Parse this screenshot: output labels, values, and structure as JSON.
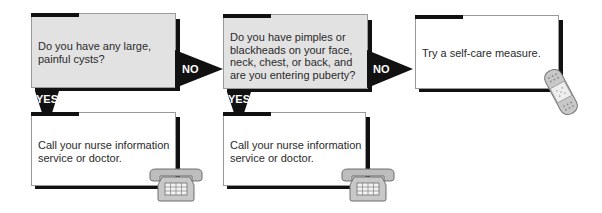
{
  "diagram": {
    "type": "flowchart",
    "nodes": [
      {
        "id": "q1",
        "kind": "question",
        "text": "Do you have any large, painful cysts?"
      },
      {
        "id": "q2",
        "kind": "question",
        "text": "Do you have pimples or blackheads on your face, neck, chest, or back, and are you entering puberty?"
      },
      {
        "id": "a_selfcare",
        "kind": "outcome",
        "text": "Try a self-care measure.",
        "icon": "bandage-icon"
      },
      {
        "id": "a_call1",
        "kind": "outcome",
        "text": "Call your nurse information service or doctor.",
        "icon": "telephone-icon"
      },
      {
        "id": "a_call2",
        "kind": "outcome",
        "text": "Call your nurse information service or doctor.",
        "icon": "telephone-icon"
      }
    ],
    "edges": [
      {
        "from": "q1",
        "to": "q2",
        "label": "NO"
      },
      {
        "from": "q1",
        "to": "a_call1",
        "label": "YES"
      },
      {
        "from": "q2",
        "to": "a_selfcare",
        "label": "NO"
      },
      {
        "from": "q2",
        "to": "a_call2",
        "label": "YES"
      }
    ]
  },
  "colors": {
    "question_fill": "#e2e2e2",
    "outcome_fill": "#ffffff",
    "accent": "#111111"
  }
}
